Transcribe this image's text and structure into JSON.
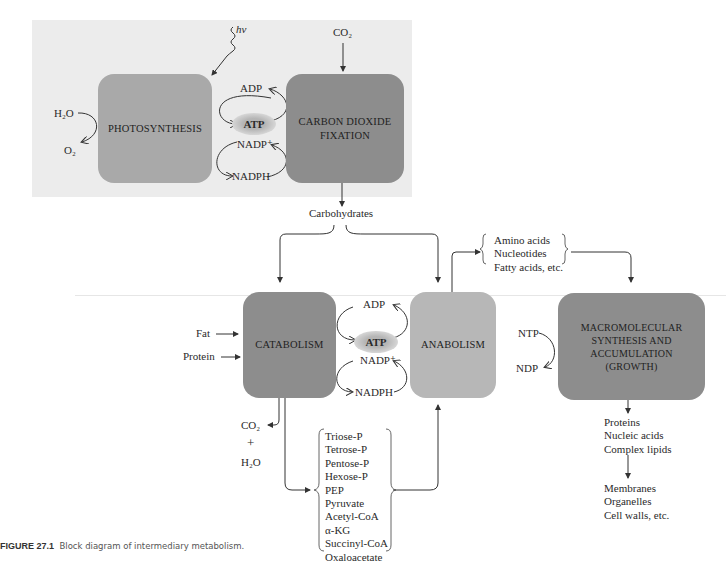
{
  "figure": {
    "number_label": "FIGURE 27.1",
    "caption": "Block diagram of intermediary metabolism."
  },
  "top_panel": {
    "light_label": "hν",
    "co2_in_label": "CO₂",
    "photosynthesis": {
      "box_label": "PHOTOSYNTHESIS",
      "input": "H₂O",
      "output": "O₂"
    },
    "co2_fixation": {
      "box_label_line1": "CARBON DIOXIDE",
      "box_label_line2": "FIXATION"
    },
    "cofactors": {
      "adp": "ADP",
      "atp": "ATP",
      "nadp": "NADP⁺",
      "nadph": "NADPH"
    }
  },
  "carbohydrates_label": "Carbohydrates",
  "middle": {
    "catabolism": {
      "box_label": "CATABOLISM",
      "inputs": [
        "Fat",
        "Protein"
      ],
      "outputs": [
        "CO₂",
        "+",
        "H₂O"
      ]
    },
    "cofactors": {
      "adp": "ADP",
      "atp": "ATP",
      "nadp": "NADP⁺",
      "nadph": "NADPH"
    },
    "anabolism": {
      "box_label": "ANABOLISM"
    },
    "building_blocks": [
      "Amino acids",
      "Nucleotides",
      "Fatty acids, etc."
    ],
    "intermediates": [
      "Triose-P",
      "Tetrose-P",
      "Pentose-P",
      "Hexose-P",
      "PEP",
      "Pyruvate",
      "Acetyl-CoA",
      "α-KG",
      "Succinyl-CoA",
      "Oxaloacetate"
    ],
    "macromolecular": {
      "box_label_lines": [
        "MACROMOLECULAR",
        "SYNTHESIS AND",
        "ACCUMULATION",
        "(GROWTH)"
      ],
      "ntp": "NTP",
      "ndp": "NDP",
      "products": [
        "Proteins",
        "Nucleic acids",
        "Complex lipids"
      ],
      "structures": [
        "Membranes",
        "Organelles",
        "Cell walls, etc."
      ]
    }
  },
  "colors": {
    "panel_bg": "#ececec",
    "box_medium": "#a9a9a9",
    "box_dark": "#8d8d8d",
    "box_light": "#b7b7b7",
    "line": "#333333"
  }
}
